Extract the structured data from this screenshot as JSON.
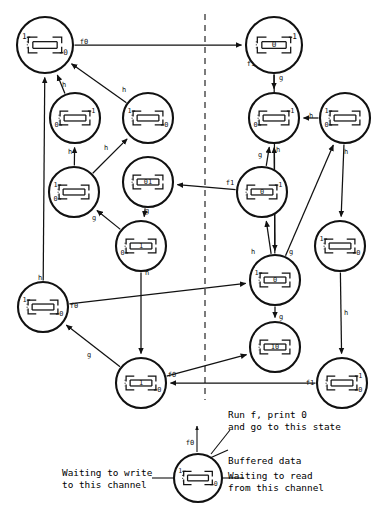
{
  "figure": {
    "type": "state-transition-diagram",
    "title": ""
  },
  "symbols": {
    "waiting_write_mark": "⟶",
    "waiting_read_mark": "⟵",
    "bracket_top": "┌",
    "bracket_bottom": "└"
  },
  "divider": {
    "name": "vertical-dashed-divider",
    "x": 205,
    "y1": 14,
    "y2": 400,
    "dash": "6 5"
  },
  "nodes": [
    {
      "id": "n1",
      "cx": 45,
      "cy": 45,
      "r": 28,
      "top": "1",
      "bottom": "0",
      "buffer": "",
      "read_top": false,
      "write_top": true,
      "read_bottom": true,
      "write_bottom": false
    },
    {
      "id": "n2",
      "cx": 274,
      "cy": 45,
      "r": 28,
      "top": "1",
      "bottom": "",
      "buffer": "0",
      "read_top": true,
      "write_top": false,
      "read_bottom": false,
      "write_bottom": false
    },
    {
      "id": "n3",
      "cx": 75,
      "cy": 118,
      "r": 25,
      "top": "1",
      "bottom": "0",
      "buffer": "",
      "read_top": true,
      "write_top": false,
      "read_bottom": false,
      "write_bottom": true
    },
    {
      "id": "n4",
      "cx": 148,
      "cy": 118,
      "r": 25,
      "top": "1",
      "bottom": "0",
      "buffer": "",
      "read_top": false,
      "write_top": true,
      "read_bottom": true,
      "write_bottom": false
    },
    {
      "id": "n5",
      "cx": 274,
      "cy": 118,
      "r": 25,
      "top": "1",
      "bottom": "0",
      "buffer": "",
      "read_top": true,
      "write_top": false,
      "read_bottom": false,
      "write_bottom": true
    },
    {
      "id": "n6",
      "cx": 345,
      "cy": 118,
      "r": 25,
      "top": "1",
      "bottom": "0",
      "buffer": "",
      "read_top": false,
      "write_top": true,
      "read_bottom": false,
      "write_bottom": true
    },
    {
      "id": "n7",
      "cx": 74,
      "cy": 192,
      "r": 25,
      "top": "1",
      "bottom": "0",
      "buffer": "",
      "read_top": false,
      "write_top": true,
      "read_bottom": false,
      "write_bottom": true
    },
    {
      "id": "n8",
      "cx": 148,
      "cy": 182,
      "r": 25,
      "top": "",
      "bottom": "",
      "buffer": "01",
      "read_top": false,
      "write_top": false,
      "read_bottom": false,
      "write_bottom": false
    },
    {
      "id": "n9",
      "cx": 262,
      "cy": 192,
      "r": 25,
      "top": "1",
      "bottom": "",
      "buffer": "0",
      "read_top": true,
      "write_top": false,
      "read_bottom": false,
      "write_bottom": false
    },
    {
      "id": "n10",
      "cx": 141,
      "cy": 246,
      "r": 25,
      "top": "",
      "bottom": "0",
      "buffer": "1",
      "read_top": false,
      "write_top": false,
      "read_bottom": false,
      "write_bottom": true
    },
    {
      "id": "n11",
      "cx": 275,
      "cy": 280,
      "r": 25,
      "top": "1",
      "bottom": "",
      "buffer": "0",
      "read_top": false,
      "write_top": true,
      "read_bottom": false,
      "write_bottom": false
    },
    {
      "id": "n12",
      "cx": 340,
      "cy": 246,
      "r": 25,
      "top": "1",
      "bottom": "0",
      "buffer": "",
      "read_top": false,
      "write_top": true,
      "read_bottom": true,
      "write_bottom": false
    },
    {
      "id": "n13",
      "cx": 43,
      "cy": 307,
      "r": 25,
      "top": "1",
      "bottom": "0",
      "buffer": "",
      "read_top": false,
      "write_top": true,
      "read_bottom": true,
      "write_bottom": false
    },
    {
      "id": "n14",
      "cx": 275,
      "cy": 347,
      "r": 25,
      "top": "",
      "bottom": "",
      "buffer": "10",
      "read_top": false,
      "write_top": false,
      "read_bottom": false,
      "write_bottom": false
    },
    {
      "id": "n15",
      "cx": 141,
      "cy": 383,
      "r": 25,
      "top": "",
      "bottom": "0",
      "buffer": "1",
      "read_top": false,
      "write_top": false,
      "read_bottom": true,
      "write_bottom": false
    },
    {
      "id": "n16",
      "cx": 342,
      "cy": 383,
      "r": 25,
      "top": "1",
      "bottom": "0",
      "buffer": "",
      "read_top": true,
      "write_top": false,
      "read_bottom": true,
      "write_bottom": false
    }
  ],
  "edges": [
    {
      "from": "n1",
      "to": "n2",
      "label": "f0",
      "lx": 84,
      "ly": 42
    },
    {
      "from": "n2",
      "to": "n5",
      "label": "g",
      "lx": 281,
      "ly": 78
    },
    {
      "from": "n3",
      "to": "n1",
      "label": "h",
      "lx": 64,
      "ly": 85
    },
    {
      "from": "n4",
      "to": "n1",
      "label": "h",
      "lx": 124,
      "ly": 90
    },
    {
      "from": "n7",
      "to": "n3",
      "label": "h",
      "lx": 70,
      "ly": 152
    },
    {
      "from": "n7",
      "to": "n4",
      "label": "h",
      "lx": 106,
      "ly": 148
    },
    {
      "from": "n6",
      "to": "n5",
      "label": "h",
      "lx": 311,
      "ly": 116
    },
    {
      "from": "n9",
      "to": "n5",
      "label": "g",
      "lx": 260,
      "ly": 155
    },
    {
      "from": "n8",
      "to": "n10",
      "label": "g",
      "lx": 147,
      "ly": 211
    },
    {
      "from": "n10",
      "to": "n7",
      "label": "g",
      "lx": 94,
      "ly": 218
    },
    {
      "from": "n10",
      "to": "n15",
      "label": "h",
      "lx": 147,
      "ly": 273
    },
    {
      "from": "n11",
      "to": "n9",
      "label": "h",
      "lx": 253,
      "ly": 252
    },
    {
      "from": "n11",
      "to": "n5",
      "label": "h",
      "lx": 278,
      "ly": 150
    },
    {
      "from": "n11",
      "to": "n6",
      "label": "g",
      "lx": 291,
      "ly": 252
    },
    {
      "from": "n11",
      "to": "n14",
      "label": "g",
      "lx": 281,
      "ly": 317
    },
    {
      "from": "n12",
      "to": "n16",
      "label": "h",
      "lx": 346,
      "ly": 313
    },
    {
      "from": "n6",
      "to": "n12",
      "label": "h",
      "lx": 346,
      "ly": 152
    },
    {
      "from": "n13",
      "to": "n11",
      "label": "f0",
      "lx": 74,
      "ly": 306
    },
    {
      "from": "n15",
      "to": "n13",
      "label": "g",
      "lx": 89,
      "ly": 355
    },
    {
      "from": "n15",
      "to": "n14",
      "label": "f0",
      "lx": 172,
      "ly": 375
    },
    {
      "from": "n16",
      "to": "n15",
      "label": "f1",
      "lx": 310,
      "ly": 383
    },
    {
      "from": "n2",
      "to": "n11",
      "label": "f1",
      "lx": 251,
      "ly": 64
    },
    {
      "from": "n9",
      "to": "n8",
      "label": "f1",
      "lx": 230,
      "ly": 183
    },
    {
      "from": "n13",
      "to": "n1",
      "label": "h",
      "lx": 40,
      "ly": 278
    }
  ],
  "legend": {
    "run_line1": "Run f, print 0",
    "run_line2": "and go to this state",
    "edge_label": "f0",
    "buffered": "Buffered data",
    "write_line1": "Waiting to write",
    "write_line2": "to this channel",
    "read_line1": "Waiting to read",
    "read_line2": "from this channel",
    "node": {
      "cx": 198,
      "cy": 478,
      "r": 24,
      "top": "1",
      "bottom": "0",
      "buffer": "",
      "read_top": false,
      "write_top": true,
      "read_bottom": true,
      "write_bottom": false
    }
  }
}
